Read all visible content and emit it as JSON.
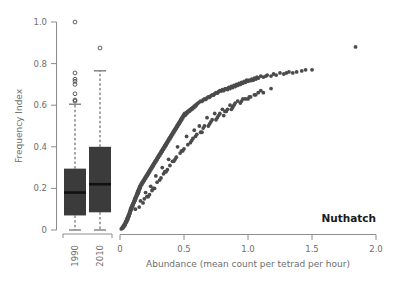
{
  "figure": {
    "species_label": "Nuthatch",
    "background_color": "#ffffff",
    "point_color": "#4b4b4b",
    "box_color": "#3b3b3b",
    "axis_color": "#8c8c8c",
    "text_color": "#6e6e6e"
  },
  "chart_data": {
    "type": "scatter",
    "title": "",
    "subtitle": "",
    "annotation": "Nuthatch",
    "xlabel": "Abundance (mean count per tetrad per hour)",
    "ylabel": "Frequency Index",
    "xlim": [
      0,
      2.0
    ],
    "ylim": [
      0,
      1.0
    ],
    "xticks": [
      0,
      0.5,
      1.0,
      1.5,
      2.0
    ],
    "xtick_labels": [
      "0",
      "0.5",
      "1.0",
      "1.5",
      "2.0"
    ],
    "yticks": [
      0,
      0.2,
      0.4,
      0.6,
      0.8,
      1.0
    ],
    "ytick_labels": [
      "0",
      "0.2",
      "0.4",
      "0.6",
      "0.8",
      "1.0"
    ],
    "grid": false,
    "legend": false,
    "legend_position": "none",
    "series": [
      {
        "name": "Nuthatch tetrad records",
        "marker": "filled-circle",
        "color": "#4b4b4b",
        "x": [
          0.01,
          0.015,
          0.02,
          0.02,
          0.025,
          0.03,
          0.03,
          0.035,
          0.035,
          0.04,
          0.04,
          0.042,
          0.045,
          0.045,
          0.05,
          0.05,
          0.052,
          0.055,
          0.055,
          0.058,
          0.06,
          0.06,
          0.062,
          0.065,
          0.065,
          0.068,
          0.07,
          0.07,
          0.072,
          0.075,
          0.075,
          0.078,
          0.08,
          0.08,
          0.082,
          0.085,
          0.085,
          0.088,
          0.09,
          0.09,
          0.092,
          0.095,
          0.095,
          0.098,
          0.1,
          0.1,
          0.102,
          0.105,
          0.105,
          0.108,
          0.11,
          0.11,
          0.112,
          0.115,
          0.115,
          0.118,
          0.12,
          0.12,
          0.122,
          0.125,
          0.125,
          0.128,
          0.13,
          0.13,
          0.132,
          0.135,
          0.135,
          0.138,
          0.14,
          0.14,
          0.142,
          0.145,
          0.145,
          0.148,
          0.15,
          0.15,
          0.152,
          0.155,
          0.155,
          0.158,
          0.16,
          0.16,
          0.165,
          0.17,
          0.17,
          0.175,
          0.18,
          0.18,
          0.185,
          0.19,
          0.19,
          0.195,
          0.2,
          0.2,
          0.205,
          0.21,
          0.21,
          0.215,
          0.22,
          0.22,
          0.225,
          0.23,
          0.23,
          0.235,
          0.24,
          0.24,
          0.245,
          0.25,
          0.25,
          0.255,
          0.26,
          0.26,
          0.265,
          0.27,
          0.27,
          0.275,
          0.28,
          0.28,
          0.285,
          0.29,
          0.29,
          0.295,
          0.3,
          0.3,
          0.305,
          0.31,
          0.31,
          0.315,
          0.32,
          0.32,
          0.325,
          0.33,
          0.33,
          0.335,
          0.34,
          0.34,
          0.345,
          0.35,
          0.35,
          0.355,
          0.36,
          0.36,
          0.365,
          0.37,
          0.37,
          0.375,
          0.38,
          0.38,
          0.385,
          0.39,
          0.39,
          0.395,
          0.4,
          0.4,
          0.405,
          0.41,
          0.41,
          0.415,
          0.42,
          0.42,
          0.425,
          0.43,
          0.43,
          0.435,
          0.44,
          0.44,
          0.445,
          0.45,
          0.45,
          0.455,
          0.46,
          0.46,
          0.465,
          0.47,
          0.47,
          0.475,
          0.48,
          0.48,
          0.485,
          0.49,
          0.49,
          0.495,
          0.5,
          0.5,
          0.505,
          0.51,
          0.515,
          0.52,
          0.525,
          0.53,
          0.535,
          0.54,
          0.545,
          0.55,
          0.555,
          0.56,
          0.565,
          0.57,
          0.575,
          0.58,
          0.585,
          0.59,
          0.595,
          0.6,
          0.61,
          0.62,
          0.63,
          0.64,
          0.65,
          0.66,
          0.67,
          0.68,
          0.69,
          0.7,
          0.71,
          0.72,
          0.73,
          0.74,
          0.75,
          0.76,
          0.77,
          0.78,
          0.79,
          0.8,
          0.81,
          0.82,
          0.83,
          0.84,
          0.85,
          0.86,
          0.87,
          0.88,
          0.89,
          0.9,
          0.91,
          0.92,
          0.93,
          0.94,
          0.95,
          0.96,
          0.97,
          0.98,
          0.99,
          1.0,
          1.01,
          1.02,
          1.03,
          1.04,
          1.05,
          1.06,
          1.07,
          1.08,
          1.1,
          1.12,
          1.14,
          1.15,
          1.18,
          1.2,
          1.22,
          1.25,
          1.28,
          1.3,
          1.32,
          1.35,
          1.38,
          1.42,
          1.45,
          1.5,
          1.84,
          0.12,
          0.16,
          0.2,
          0.24,
          0.28,
          0.33,
          0.38,
          0.45,
          0.52,
          0.58,
          0.62,
          0.68,
          0.74,
          0.8,
          0.86,
          0.92,
          0.98,
          1.05,
          1.12,
          1.18,
          0.22,
          0.27,
          0.31,
          0.36,
          0.42,
          0.48,
          0.55,
          0.6,
          0.66,
          0.72,
          0.78,
          0.84,
          0.9,
          0.96,
          1.02,
          1.08,
          0.15,
          0.19,
          0.23,
          0.26,
          0.29,
          0.34,
          0.39,
          0.44,
          0.5,
          0.56,
          0.64,
          0.7,
          0.76,
          0.82,
          0.88,
          0.94,
          1.0,
          1.06,
          1.1,
          0.35,
          0.41,
          0.47,
          0.53,
          0.59,
          0.65,
          0.71,
          0.77,
          0.83,
          0.89,
          0.95,
          1.01,
          0.18,
          0.21,
          0.25,
          0.32,
          0.37,
          0.43,
          0.49,
          0.57,
          0.63,
          0.69,
          0.75,
          0.81,
          0.87
        ],
        "y": [
          0.005,
          0.008,
          0.01,
          0.015,
          0.012,
          0.018,
          0.022,
          0.02,
          0.028,
          0.025,
          0.032,
          0.03,
          0.035,
          0.04,
          0.038,
          0.045,
          0.042,
          0.05,
          0.055,
          0.048,
          0.052,
          0.06,
          0.058,
          0.062,
          0.07,
          0.065,
          0.068,
          0.075,
          0.072,
          0.078,
          0.085,
          0.08,
          0.088,
          0.095,
          0.09,
          0.098,
          0.105,
          0.1,
          0.11,
          0.102,
          0.108,
          0.115,
          0.12,
          0.112,
          0.118,
          0.125,
          0.122,
          0.13,
          0.128,
          0.135,
          0.14,
          0.132,
          0.138,
          0.145,
          0.15,
          0.142,
          0.148,
          0.155,
          0.152,
          0.16,
          0.158,
          0.165,
          0.17,
          0.162,
          0.168,
          0.175,
          0.18,
          0.172,
          0.178,
          0.185,
          0.19,
          0.182,
          0.188,
          0.195,
          0.2,
          0.192,
          0.198,
          0.205,
          0.21,
          0.202,
          0.208,
          0.215,
          0.22,
          0.218,
          0.225,
          0.23,
          0.228,
          0.235,
          0.24,
          0.238,
          0.245,
          0.25,
          0.248,
          0.255,
          0.26,
          0.258,
          0.265,
          0.27,
          0.268,
          0.275,
          0.28,
          0.278,
          0.285,
          0.29,
          0.288,
          0.295,
          0.3,
          0.298,
          0.305,
          0.31,
          0.308,
          0.315,
          0.32,
          0.318,
          0.325,
          0.33,
          0.328,
          0.335,
          0.34,
          0.338,
          0.345,
          0.35,
          0.348,
          0.355,
          0.36,
          0.358,
          0.365,
          0.37,
          0.368,
          0.375,
          0.38,
          0.378,
          0.385,
          0.39,
          0.388,
          0.395,
          0.4,
          0.398,
          0.405,
          0.41,
          0.408,
          0.415,
          0.42,
          0.418,
          0.425,
          0.43,
          0.428,
          0.435,
          0.44,
          0.438,
          0.445,
          0.45,
          0.448,
          0.455,
          0.46,
          0.458,
          0.465,
          0.47,
          0.468,
          0.475,
          0.48,
          0.478,
          0.485,
          0.49,
          0.488,
          0.495,
          0.5,
          0.498,
          0.505,
          0.51,
          0.508,
          0.515,
          0.52,
          0.518,
          0.525,
          0.53,
          0.528,
          0.535,
          0.54,
          0.538,
          0.545,
          0.55,
          0.548,
          0.555,
          0.56,
          0.552,
          0.558,
          0.565,
          0.562,
          0.57,
          0.568,
          0.575,
          0.572,
          0.58,
          0.578,
          0.585,
          0.582,
          0.59,
          0.588,
          0.595,
          0.592,
          0.6,
          0.598,
          0.605,
          0.61,
          0.615,
          0.62,
          0.618,
          0.625,
          0.63,
          0.628,
          0.635,
          0.64,
          0.638,
          0.645,
          0.65,
          0.648,
          0.655,
          0.66,
          0.658,
          0.665,
          0.67,
          0.668,
          0.675,
          0.67,
          0.678,
          0.68,
          0.675,
          0.685,
          0.68,
          0.69,
          0.685,
          0.695,
          0.69,
          0.7,
          0.695,
          0.705,
          0.7,
          0.71,
          0.705,
          0.715,
          0.71,
          0.72,
          0.715,
          0.72,
          0.718,
          0.725,
          0.72,
          0.73,
          0.725,
          0.735,
          0.73,
          0.74,
          0.735,
          0.74,
          0.745,
          0.74,
          0.75,
          0.745,
          0.755,
          0.75,
          0.755,
          0.76,
          0.755,
          0.76,
          0.765,
          0.77,
          0.77,
          0.88,
          0.1,
          0.14,
          0.18,
          0.21,
          0.26,
          0.3,
          0.34,
          0.4,
          0.45,
          0.48,
          0.5,
          0.54,
          0.56,
          0.58,
          0.6,
          0.62,
          0.63,
          0.65,
          0.66,
          0.68,
          0.16,
          0.2,
          0.24,
          0.28,
          0.33,
          0.38,
          0.42,
          0.46,
          0.5,
          0.53,
          0.56,
          0.58,
          0.61,
          0.63,
          0.64,
          0.66,
          0.11,
          0.15,
          0.17,
          0.2,
          0.23,
          0.27,
          0.31,
          0.35,
          0.39,
          0.43,
          0.47,
          0.51,
          0.54,
          0.57,
          0.59,
          0.61,
          0.63,
          0.65,
          0.67,
          0.28,
          0.33,
          0.37,
          0.41,
          0.45,
          0.49,
          0.52,
          0.55,
          0.57,
          0.6,
          0.62,
          0.64,
          0.13,
          0.16,
          0.19,
          0.25,
          0.29,
          0.34,
          0.38,
          0.44,
          0.47,
          0.5,
          0.53,
          0.55,
          0.58
        ]
      }
    ],
    "boxplots": [
      {
        "label": "1990",
        "min_whisker": 0.0,
        "q1": 0.07,
        "median": 0.18,
        "q3": 0.295,
        "max_whisker": 0.605,
        "outliers": [
          0.62,
          0.625,
          0.655,
          0.7,
          0.715,
          0.725,
          0.755,
          1.0
        ]
      },
      {
        "label": "2010",
        "min_whisker": 0.0,
        "q1": 0.085,
        "median": 0.22,
        "q3": 0.4,
        "max_whisker": 0.765,
        "outliers": [
          0.875
        ]
      }
    ]
  }
}
